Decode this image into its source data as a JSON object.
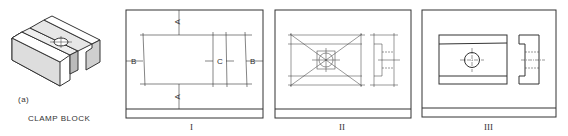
{
  "figure": {
    "part_label": "(a)",
    "part_name": "CLAMP BLOCK",
    "panels": [
      {
        "id": "I",
        "caption": "I",
        "dimension_labels": [
          "A",
          "A",
          "B",
          "C",
          "B"
        ]
      },
      {
        "id": "II",
        "caption": "II"
      },
      {
        "id": "III",
        "caption": "III"
      }
    ]
  },
  "colors": {
    "line": "#333333",
    "shade": "#cfcfcf",
    "background": "#ffffff"
  }
}
